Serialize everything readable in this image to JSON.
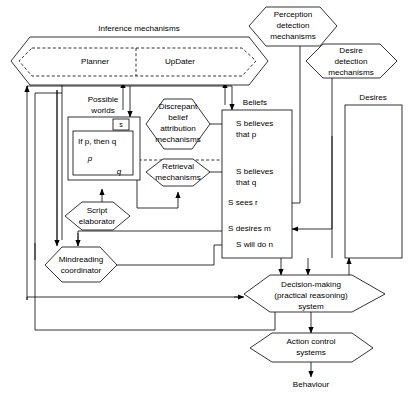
{
  "figure": {
    "type": "block-diagram",
    "background_color": "#ffffff",
    "line_color": "#000000"
  },
  "nodes": {
    "inference_mechanisms": {
      "label": "Inference mechanisms",
      "shape": "hexagon",
      "sub_left": "Planner",
      "sub_right": "UpDater"
    },
    "perception_detection": {
      "label_lines": [
        "Perception",
        "detection",
        "mechanisms"
      ],
      "shape": "hexagon"
    },
    "desire_detection": {
      "label_lines": [
        "Desire",
        "detection",
        "mechanisms"
      ],
      "shape": "hexagon"
    },
    "discrepant_belief": {
      "label_lines": [
        "Discrepant",
        "belief",
        "attribution",
        "mechanisms"
      ],
      "shape": "hexagon"
    },
    "retrieval": {
      "label_lines": [
        "Retrieval",
        "mechanisms"
      ],
      "shape": "hexagon"
    },
    "script_elaborator": {
      "label_lines": [
        "Script",
        "elaborator"
      ],
      "shape": "hexagon"
    },
    "mindreading_coordinator": {
      "label_lines": [
        "Mindreading",
        "coordinator"
      ],
      "shape": "hexagon"
    },
    "decision_making": {
      "label_lines": [
        "Decision-making",
        "(practical reasoning)",
        "system"
      ],
      "shape": "hexagon"
    },
    "action_control": {
      "label_lines": [
        "Action control",
        "systems"
      ],
      "shape": "hexagon"
    },
    "behaviour": {
      "label": "Behaviour",
      "shape": "text"
    },
    "possible_worlds": {
      "label_lines": [
        "Possible",
        "worlds"
      ],
      "shape": "box-label"
    },
    "possible_worlds_box": {
      "tab_label": "s",
      "contents": [
        "If p, then q",
        "p",
        "q"
      ],
      "shape": "nested-box"
    },
    "beliefs": {
      "label": "Beliefs",
      "shape": "box",
      "items": [
        "S believes",
        "that p",
        "S believes",
        "that q",
        "S sees r",
        "S desires m",
        "S will do n"
      ],
      "entries": [
        {
          "line1": "S believes",
          "line2": "that p"
        },
        {
          "line1": "S believes",
          "line2": "that q"
        },
        {
          "line1": "S sees r",
          "line2": ""
        },
        {
          "line1": "S desires m",
          "line2": ""
        },
        {
          "line1": "S will do n",
          "line2": ""
        }
      ]
    },
    "desires": {
      "label": "Desires",
      "shape": "box",
      "items": []
    }
  }
}
